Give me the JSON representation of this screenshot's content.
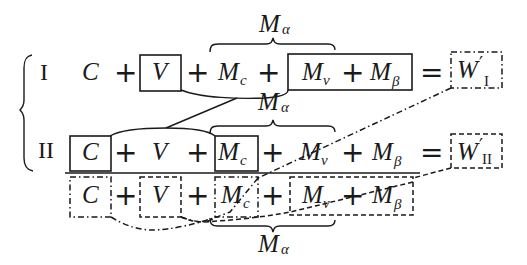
{
  "diagram": {
    "type": "equation-scheme",
    "left_brace": "{",
    "rows": [
      {
        "label": "I",
        "terms": [
          "C",
          "+",
          "V",
          "+",
          "M_c",
          "+",
          "M_v",
          "+",
          "M_β",
          "=",
          "W'_I"
        ],
        "boxed_solid": [
          "V",
          "M_v + M_β"
        ],
        "boxed_dashdot": [
          "W'_I"
        ],
        "brace_over": {
          "from": "M_c",
          "to": "M_v",
          "label": "M_α"
        }
      },
      {
        "label": "II",
        "terms": [
          "C",
          "+",
          "V",
          "+",
          "M_c",
          "+",
          "M_v",
          "+",
          "M_β",
          "=",
          "W'_II"
        ],
        "boxed_solid": [
          "C",
          "M_c"
        ],
        "boxed_dashed": [
          "W'_II"
        ],
        "brace_over": {
          "from": "M_c",
          "to": "M_v",
          "label": "M_α"
        }
      },
      {
        "label": "",
        "terms": [
          "C",
          "+",
          "V",
          "+",
          "M_c",
          "+",
          "M_v",
          "+",
          "M_β"
        ],
        "boxed_dashdot": [
          "C",
          "M_c"
        ],
        "boxed_dashed": [
          "V",
          "M_v + M_β"
        ],
        "brace_under": {
          "from": "M_c",
          "to": "M_v",
          "label": "M_α"
        }
      }
    ],
    "connectors": [
      {
        "from": "I.V+Mv+Mβ",
        "to": "II.C+Mc",
        "style": "solid"
      },
      {
        "from": "I.W'_I",
        "to": "III.C+Mc",
        "style": "dash-dot"
      },
      {
        "from": "II.W'_II",
        "to": "III.V+Mv+Mβ",
        "style": "dashed"
      }
    ]
  },
  "labels": {
    "roman_I": "I",
    "roman_II": "II",
    "C": "C",
    "V": "V",
    "M": "M",
    "plus": "+",
    "equals": "=",
    "sub_c": "c",
    "sub_v": "v",
    "sub_beta": "β",
    "sub_alpha": "α",
    "W": "W",
    "prime": "′",
    "sub_I": "I",
    "sub_II": "II"
  }
}
